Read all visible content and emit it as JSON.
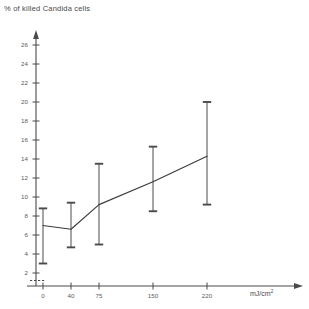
{
  "title": "% of killed Candida cells",
  "x_axis_unit_numerator": "mJ",
  "x_axis_unit_denominator": "cm",
  "x_axis_unit_exponent": "2",
  "colors": {
    "axis": "#4a4a4a",
    "line": "#3c3c3c",
    "errorbar": "#4a4a4a",
    "text": "#4a4a4a",
    "background": "#ffffff"
  },
  "chart_data": {
    "type": "line",
    "title": "% of killed Candida cells",
    "xlabel": "mJ/cm²",
    "ylabel": "% of killed Candida cells",
    "grid": false,
    "legend": null,
    "ylim": [
      0,
      27
    ],
    "y_ticks": [
      2,
      4,
      6,
      8,
      10,
      12,
      14,
      16,
      18,
      20,
      22,
      24,
      26
    ],
    "x_ticks": [
      0,
      40,
      75,
      150,
      220
    ],
    "x_tick_labels": [
      "0",
      "40",
      "75",
      "150",
      "220"
    ],
    "x_scale": "categorical-spaced",
    "categories": [
      "0",
      "40",
      "75",
      "150",
      "220"
    ],
    "values": [
      7.0,
      6.6,
      9.2,
      11.6,
      14.3
    ],
    "error_bars": {
      "lower": [
        3.0,
        4.7,
        5.0,
        8.5,
        9.2
      ],
      "upper": [
        8.8,
        9.4,
        13.5,
        15.3,
        20.0
      ]
    },
    "points": [
      {
        "x": 0,
        "x_label": "0",
        "y": 7.0,
        "err_low": 3.0,
        "err_high": 8.8
      },
      {
        "x": 40,
        "x_label": "40",
        "y": 6.6,
        "err_low": 4.7,
        "err_high": 9.4
      },
      {
        "x": 75,
        "x_label": "75",
        "y": 9.2,
        "err_low": 5.0,
        "err_high": 13.5
      },
      {
        "x": 150,
        "x_label": "150",
        "y": 11.6,
        "err_low": 8.5,
        "err_high": 15.3
      },
      {
        "x": 220,
        "x_label": "220",
        "y": 14.3,
        "err_low": 9.2,
        "err_high": 20.0
      }
    ]
  }
}
